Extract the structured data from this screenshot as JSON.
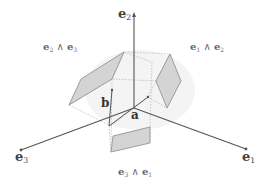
{
  "diagram": {
    "type": "geometric-algebra-basis-bivectors",
    "colors": {
      "axis": "#555555",
      "vector": "#555555",
      "plane_fill": "#d4d4d4",
      "plane_stroke": "#999999",
      "dotted": "#aaaaaa",
      "label": "#555555"
    },
    "axes": [
      {
        "id": "e1",
        "name": "e",
        "sub": "1"
      },
      {
        "id": "e2",
        "name": "e",
        "sub": "2"
      },
      {
        "id": "e3",
        "name": "e",
        "sub": "3"
      }
    ],
    "vectors": [
      {
        "id": "a",
        "label": "a"
      },
      {
        "id": "b",
        "label": "b"
      }
    ],
    "planes": [
      {
        "id": "e2_wedge_e3",
        "left": {
          "name": "e",
          "sub": "2"
        },
        "op": "∧",
        "right": {
          "name": "e",
          "sub": "3"
        }
      },
      {
        "id": "e1_wedge_e2",
        "left": {
          "name": "e",
          "sub": "1"
        },
        "op": "∧",
        "right": {
          "name": "e",
          "sub": "2"
        }
      },
      {
        "id": "e3_wedge_e1",
        "left": {
          "name": "e",
          "sub": "3"
        },
        "op": "∧",
        "right": {
          "name": "e",
          "sub": "1"
        }
      }
    ]
  }
}
